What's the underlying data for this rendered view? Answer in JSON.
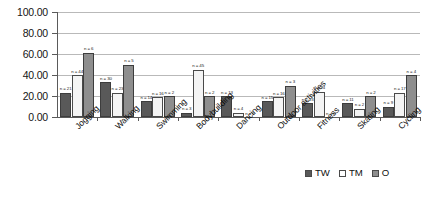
{
  "chart_data": {
    "type": "bar",
    "title": "",
    "xlabel": "",
    "ylabel": "",
    "ylim": [
      0,
      100
    ],
    "ytick_labels": [
      "100.00",
      "80.00",
      "60.00",
      "40.00",
      "20.00",
      "0.00"
    ],
    "ytick_values": [
      100,
      80,
      60,
      40,
      20,
      0
    ],
    "grid": true,
    "legend_position": "bottom-right",
    "categories": [
      "Jogging",
      "Walking",
      "Swimming",
      "Bodybuilding",
      "Dancing",
      "Outdoor activities",
      "Fitness",
      "Skating",
      "Cycling"
    ],
    "series": [
      {
        "name": "TW",
        "color": "#595959",
        "values": [
          23,
          33,
          15,
          4,
          20,
          15,
          13,
          13,
          10
        ],
        "point_labels": [
          "n = 21",
          "n = 30",
          "n = 14",
          "n = 3",
          "n = 13",
          "n = 15",
          "n = 13",
          "n = 11",
          "n = 9"
        ]
      },
      {
        "name": "TM",
        "color": "#f4f4f4",
        "values": [
          40,
          23,
          19,
          45,
          4,
          19,
          24,
          8,
          23
        ],
        "point_labels": [
          "n = 44",
          "n = 23",
          "n = 16",
          "n = 45",
          "n = 4",
          "n = 16",
          "n = 24",
          "n = 2",
          "n = 17"
        ]
      },
      {
        "name": "O",
        "color": "#8e8e8e",
        "values": [
          61,
          50,
          20,
          20,
          0,
          30,
          0,
          20,
          40
        ],
        "point_labels": [
          "n = 6",
          "n = 5",
          "n = 2",
          "n = 2",
          "n = 0",
          "n = 3",
          "n = 0",
          "n = 2",
          "n = 4"
        ]
      }
    ],
    "legend": [
      {
        "label": "TW",
        "color": "#595959"
      },
      {
        "label": "TM",
        "color": "#ffffff"
      },
      {
        "label": "O",
        "color": "#8e8e8e"
      }
    ]
  }
}
